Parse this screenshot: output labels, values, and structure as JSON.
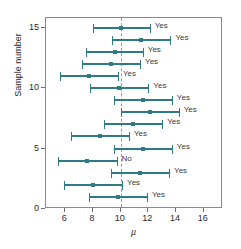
{
  "chart_data": {
    "type": "scatter",
    "title": "",
    "xlabel": "μ",
    "ylabel": "Sample number",
    "xlim": [
      4.6,
      17.4
    ],
    "ylim": [
      0,
      15.8
    ],
    "xticks": [
      6,
      8,
      10,
      12,
      14,
      16
    ],
    "yticks": [
      0,
      5,
      10,
      15
    ],
    "grid": false,
    "legend": null,
    "reference_line": {
      "orientation": "vertical",
      "value": 10,
      "style": "dashed",
      "color": "#9a9a9a"
    },
    "series_color": "#2e7b86",
    "annotation_note": "Each horizontal bar is a confidence interval for the mean; the label states whether the interval contains μ = 10.",
    "columns": [
      "sample",
      "lower",
      "center",
      "upper",
      "contains_mu"
    ],
    "intervals": [
      {
        "sample": 15,
        "lower": 8.0,
        "center": 10.0,
        "upper": 12.1,
        "contains_mu": "Yes"
      },
      {
        "sample": 14,
        "lower": 9.4,
        "center": 11.5,
        "upper": 13.6,
        "contains_mu": "Yes"
      },
      {
        "sample": 13,
        "lower": 7.5,
        "center": 9.6,
        "upper": 11.6,
        "contains_mu": "Yes"
      },
      {
        "sample": 12,
        "lower": 7.2,
        "center": 9.3,
        "upper": 11.4,
        "contains_mu": "Yes"
      },
      {
        "sample": 11,
        "lower": 5.6,
        "center": 7.7,
        "upper": 9.8,
        "contains_mu": "Yes"
      },
      {
        "sample": 10,
        "lower": 7.8,
        "center": 9.9,
        "upper": 12.0,
        "contains_mu": "Yes"
      },
      {
        "sample": 9,
        "lower": 9.5,
        "center": 11.6,
        "upper": 13.7,
        "contains_mu": "Yes"
      },
      {
        "sample": 8,
        "lower": 10.0,
        "center": 12.1,
        "upper": 14.2,
        "contains_mu": "Yes"
      },
      {
        "sample": 7,
        "lower": 8.8,
        "center": 10.9,
        "upper": 13.0,
        "contains_mu": "Yes"
      },
      {
        "sample": 6,
        "lower": 6.4,
        "center": 8.5,
        "upper": 10.6,
        "contains_mu": "Yes"
      },
      {
        "sample": 5,
        "lower": 9.5,
        "center": 11.6,
        "upper": 13.7,
        "contains_mu": "Yes"
      },
      {
        "sample": 4,
        "lower": 5.5,
        "center": 7.6,
        "upper": 9.7,
        "contains_mu": "No"
      },
      {
        "sample": 3,
        "lower": 9.3,
        "center": 11.4,
        "upper": 13.5,
        "contains_mu": "Yes"
      },
      {
        "sample": 2,
        "lower": 5.9,
        "center": 8.0,
        "upper": 10.1,
        "contains_mu": "Yes"
      },
      {
        "sample": 1,
        "lower": 7.7,
        "center": 9.8,
        "upper": 11.9,
        "contains_mu": "Yes"
      }
    ]
  }
}
